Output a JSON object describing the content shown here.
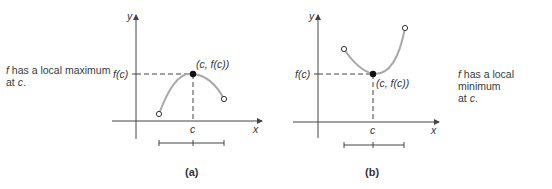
{
  "panels": [
    {
      "id": "a",
      "label": "(a)",
      "caption_prefix": "f",
      "caption_line1": " has a local maximum",
      "caption_line2_prefix": "at ",
      "caption_line2_var": "c",
      "caption_line2_suffix": ".",
      "y_axis_label": "y",
      "x_axis_label": "x",
      "y_tick_label": "f(c)",
      "x_tick_label": "c",
      "point_label": "(c, f(c))",
      "extremum": "local maximum"
    },
    {
      "id": "b",
      "label": "(b)",
      "caption_prefix": "f",
      "caption_line1": " has a local minimum",
      "caption_line2_prefix": "at ",
      "caption_line2_var": "c",
      "caption_line2_suffix": ".",
      "y_axis_label": "y",
      "x_axis_label": "x",
      "y_tick_label": "f(c)",
      "x_tick_label": "c",
      "point_label": "(c, f(c))",
      "extremum": "local minimum"
    }
  ],
  "colors": {
    "axis": "#444444",
    "curve": "#a8a8a8",
    "point": "#111111",
    "text": "#333333"
  }
}
